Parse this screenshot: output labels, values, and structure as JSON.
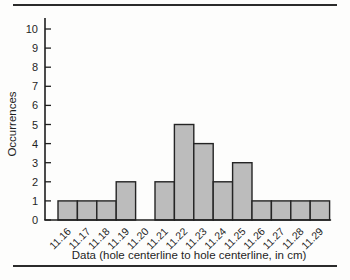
{
  "figure": {
    "kind": "scanned textbook histogram"
  },
  "chart_data": {
    "type": "bar",
    "categories": [
      "11.16",
      "11.17",
      "11.18",
      "11.19",
      "11.20",
      "11.21",
      "11.22",
      "11.23",
      "11.24",
      "11.25",
      "11.26",
      "11.27",
      "11.28",
      "11.29"
    ],
    "values": [
      1,
      1,
      1,
      2,
      0,
      2,
      5,
      4,
      2,
      3,
      1,
      1,
      1,
      1
    ],
    "title": "",
    "xlabel": "Data (hole centerline to hole centerline, in cm)",
    "ylabel": "Occurrences",
    "ylim": [
      0,
      10
    ],
    "yticks": [
      0,
      1,
      2,
      3,
      4,
      5,
      6,
      7,
      8,
      9,
      10
    ],
    "grid": false,
    "legend": null,
    "bar_fill": "#bcbcbc",
    "bar_stroke": "#242424",
    "axis_color": "#1f1f1f",
    "rule_color": "#2b2b2b"
  }
}
